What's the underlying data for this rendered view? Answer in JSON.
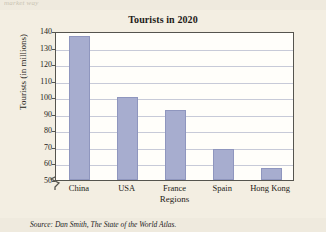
{
  "scan_artifacts": {
    "top_left_text": "market way",
    "right_text": ""
  },
  "figure": {
    "source_note_label": "Source:",
    "source_note_author": "Dan Smith,",
    "source_note_title": "The State of the World Atlas."
  },
  "chart_data": {
    "type": "bar",
    "title": "Tourists in 2020",
    "xlabel": "Regions",
    "ylabel": "Tourists (in millions)",
    "categories": [
      "China",
      "USA",
      "France",
      "Spain",
      "Hong Kong"
    ],
    "values": [
      137,
      100,
      92,
      69,
      57
    ],
    "ylim": [
      50,
      140
    ],
    "yticks": [
      50,
      60,
      70,
      80,
      90,
      100,
      110,
      120,
      130,
      140
    ],
    "ytick_labels": [
      "50",
      "60",
      "70",
      "80",
      "90",
      "100",
      "110",
      "120",
      "130",
      "140"
    ],
    "grid": true,
    "axis_break": true,
    "legend": "none",
    "bar_color": "#a7adcf",
    "bar_edge_color": "#8f96be",
    "gridline_color": "#c7cad8",
    "plot_background": "#fffefa",
    "page_background": "#efeade"
  }
}
